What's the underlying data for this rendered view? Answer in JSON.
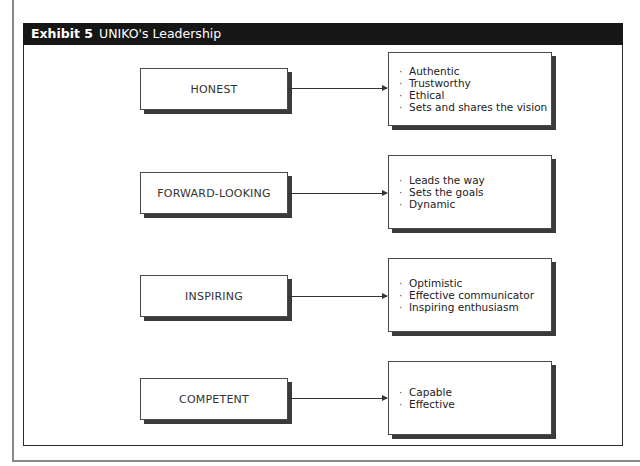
{
  "exhibit": {
    "number": "Exhibit 5",
    "title": "UNIKO's Leadership",
    "title_bar_color": "#161616"
  },
  "diagram": {
    "rows": [
      {
        "quality": "HONEST",
        "traits": [
          "Authentic",
          "Trustworthy",
          "Ethical",
          "Sets and shares the vision"
        ]
      },
      {
        "quality": "FORWARD-LOOKING",
        "traits": [
          "Leads the way",
          "Sets the goals",
          "Dynamic"
        ]
      },
      {
        "quality": "INSPIRING",
        "traits": [
          "Optimistic",
          "Effective communicator",
          "Inspiring enthusiasm"
        ]
      },
      {
        "quality": "COMPETENT",
        "traits": [
          "Capable",
          "Effective"
        ]
      }
    ],
    "bullet_glyph": "·"
  }
}
